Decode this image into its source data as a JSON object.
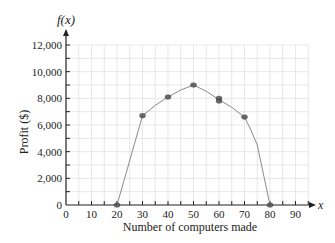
{
  "chart_data": {
    "type": "scatter",
    "title": "",
    "xlabel": "Number of computers made",
    "ylabel": "Profit ($)",
    "x_axis_name": "x",
    "y_axis_name": "f(x)",
    "xlim": [
      0,
      90
    ],
    "ylim": [
      0,
      12000
    ],
    "x_ticks": [
      0,
      10,
      20,
      30,
      40,
      50,
      60,
      70,
      80,
      90
    ],
    "x_tick_labels": [
      "0",
      "10",
      "20",
      "30",
      "40",
      "50",
      "60",
      "70",
      "80",
      "90"
    ],
    "y_ticks": [
      0,
      2000,
      4000,
      6000,
      8000,
      10000,
      12000
    ],
    "y_tick_labels": [
      "0",
      "2,000",
      "4,000",
      "6,000",
      "8,000",
      "10,000",
      "12,000"
    ],
    "grid": true,
    "series": [
      {
        "name": "Profit data",
        "points": [
          {
            "x": 20,
            "y": 0
          },
          {
            "x": 30,
            "y": 6700
          },
          {
            "x": 40,
            "y": 8100
          },
          {
            "x": 50,
            "y": 9000
          },
          {
            "x": 60,
            "y": 8000
          },
          {
            "x": 60,
            "y": 7800
          },
          {
            "x": 70,
            "y": 6600
          },
          {
            "x": 80,
            "y": 0
          }
        ]
      },
      {
        "name": "Hand-drawn fitted curve",
        "type": "line",
        "points": [
          {
            "x": 20,
            "y": 0
          },
          {
            "x": 30,
            "y": 6700
          },
          {
            "x": 40,
            "y": 8100
          },
          {
            "x": 50,
            "y": 9000
          },
          {
            "x": 60,
            "y": 7900
          },
          {
            "x": 70,
            "y": 6600
          },
          {
            "x": 75,
            "y": 4500
          },
          {
            "x": 80,
            "y": 0
          }
        ]
      }
    ]
  },
  "colors": {
    "axis": "#222222",
    "grid": "#d8d8d8",
    "curve": "#8a8a8a",
    "point": "#555555"
  }
}
